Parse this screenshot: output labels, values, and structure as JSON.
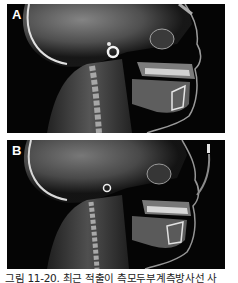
{
  "figure": {
    "panels": [
      {
        "label": "A",
        "description": "Lateral cephalometric radiograph (skull, cervical spine, jaws and teeth)"
      },
      {
        "label": "B",
        "description": "Lateral cephalometric radiograph (skull, cervical spine, jaws and teeth)"
      }
    ],
    "caption": "그림 11-20. 최근 적출이 측모두부계측방사선 사"
  },
  "colors": {
    "background": "#ffffff",
    "panel_bg": "#050505",
    "bone": "#d8d8d8"
  }
}
